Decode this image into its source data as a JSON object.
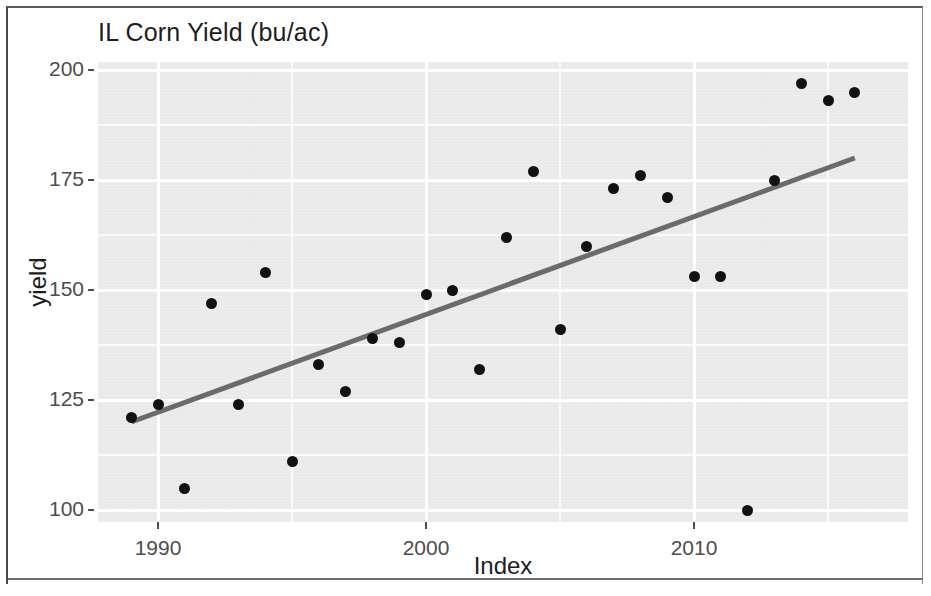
{
  "chart_data": {
    "type": "scatter",
    "title": "IL Corn Yield (bu/ac)",
    "xlabel": "Index",
    "ylabel": "yield",
    "xlim": [
      1988.2,
      1988.2
    ],
    "ylim": [
      97,
      202
    ],
    "grid": true,
    "legend": null,
    "x_ticks": [
      "1990",
      "2000",
      "2010"
    ],
    "x_tick_values": [
      1990,
      2000,
      2010
    ],
    "y_ticks": [
      "100",
      "125",
      "150",
      "175",
      "200"
    ],
    "y_tick_values": [
      100,
      125,
      150,
      175,
      200
    ],
    "x": [
      1989,
      1990,
      1991,
      1992,
      1993,
      1994,
      1995,
      1996,
      1997,
      1998,
      1999,
      2000,
      2001,
      2002,
      2003,
      2004,
      2005,
      2006,
      2007,
      2008,
      2009,
      2010,
      2011,
      2012,
      2013,
      2014,
      2015,
      2016
    ],
    "values": [
      121,
      124,
      105,
      147,
      124,
      154,
      111,
      133,
      127,
      139,
      138,
      149,
      150,
      132,
      162,
      177,
      141,
      160,
      173,
      176,
      171,
      153,
      153,
      100,
      175,
      197,
      193,
      195
    ],
    "series": [
      {
        "name": "yield",
        "marker": "filled-circle",
        "color": "#111111",
        "points": [
          {
            "x": 1989,
            "y": 121
          },
          {
            "x": 1990,
            "y": 124
          },
          {
            "x": 1991,
            "y": 105
          },
          {
            "x": 1992,
            "y": 147
          },
          {
            "x": 1993,
            "y": 124
          },
          {
            "x": 1994,
            "y": 154
          },
          {
            "x": 1995,
            "y": 111
          },
          {
            "x": 1996,
            "y": 133
          },
          {
            "x": 1997,
            "y": 127
          },
          {
            "x": 1998,
            "y": 139
          },
          {
            "x": 1999,
            "y": 138
          },
          {
            "x": 2000,
            "y": 149
          },
          {
            "x": 2001,
            "y": 150
          },
          {
            "x": 2002,
            "y": 132
          },
          {
            "x": 2003,
            "y": 162
          },
          {
            "x": 2004,
            "y": 177
          },
          {
            "x": 2005,
            "y": 141
          },
          {
            "x": 2006,
            "y": 160
          },
          {
            "x": 2007,
            "y": 173
          },
          {
            "x": 2008,
            "y": 176
          },
          {
            "x": 2009,
            "y": 171
          },
          {
            "x": 2010,
            "y": 153
          },
          {
            "x": 2011,
            "y": 153
          },
          {
            "x": 2012,
            "y": 100
          },
          {
            "x": 2013,
            "y": 175
          },
          {
            "x": 2014,
            "y": 197
          },
          {
            "x": 2015,
            "y": 193
          },
          {
            "x": 2016,
            "y": 195
          }
        ]
      }
    ],
    "trendline": {
      "name": "linear-fit",
      "color": "#6b6b6b",
      "width": 5,
      "x_start": 1989.0,
      "y_start": 120,
      "x_end": 2016.0,
      "y_end": 180
    },
    "panel_background": "#ececec",
    "gridline_color": "#ffffff"
  }
}
